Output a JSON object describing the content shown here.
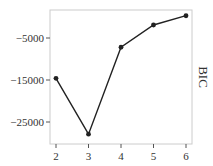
{
  "chart_data": {
    "type": "line",
    "title": "",
    "xlabel": "",
    "ylabel": "BIC",
    "ylabel_position": "right",
    "x": [
      2,
      3,
      4,
      5,
      6
    ],
    "values": [
      -14600,
      -27900,
      -7200,
      -1900,
      300
    ],
    "series": [
      {
        "name": "BIC",
        "values": [
          -14600,
          -27900,
          -7200,
          -1900,
          300
        ],
        "color": "#222222",
        "marker": "circle"
      }
    ],
    "x_ticks": [
      "2",
      "3",
      "4",
      "5",
      "6"
    ],
    "y_ticks": [
      -5000,
      -15000,
      -25000
    ],
    "y_tick_labels": [
      "-5000",
      "-15000",
      "-25000"
    ],
    "xlim": [
      1.8,
      6.2
    ],
    "ylim": [
      -30500,
      1800
    ],
    "grid": false,
    "legend": null
  },
  "colors": {
    "line": "#222222",
    "frame": "#cccccc",
    "tick": "#555555",
    "text": "#333333"
  }
}
